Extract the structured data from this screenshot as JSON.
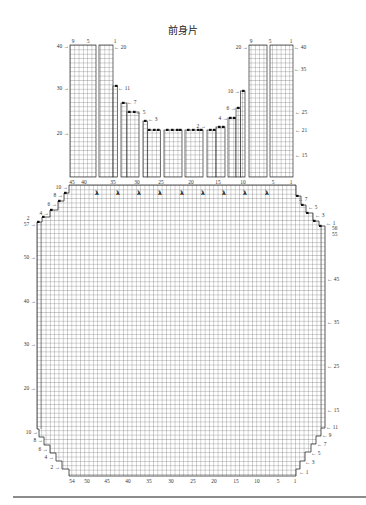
{
  "title": "前身片",
  "colors": {
    "grid_line": "#5a5a5a",
    "outline": "#2e2e2e",
    "text": "#333333",
    "footer_rule": "#666666"
  },
  "diagram": {
    "cell": {
      "w": 4.3,
      "h": 4.38
    },
    "upper_section": {
      "bottom": 177,
      "blocks": [
        {
          "x": 70,
          "w": 26,
          "top": 45
        },
        {
          "x": 99,
          "w": 14,
          "top": 45
        },
        {
          "x": 113,
          "w": 4.3,
          "top": 86
        },
        {
          "x": 121,
          "w": 6,
          "top": 103
        },
        {
          "x": 127,
          "w": 12,
          "top": 112
        },
        {
          "x": 143,
          "w": 4.3,
          "top": 121
        },
        {
          "x": 147.3,
          "w": 13,
          "top": 130
        },
        {
          "x": 164,
          "w": 18,
          "top": 130
        },
        {
          "x": 185,
          "w": 18,
          "top": 130
        },
        {
          "x": 207,
          "w": 9,
          "top": 130
        },
        {
          "x": 216,
          "w": 9,
          "top": 127
        },
        {
          "x": 228,
          "w": 8,
          "top": 118
        },
        {
          "x": 236,
          "w": 4.5,
          "top": 108
        },
        {
          "x": 240.5,
          "w": 4.5,
          "top": 91
        },
        {
          "x": 249,
          "w": 18,
          "top": 45
        },
        {
          "x": 270,
          "w": 23,
          "top": 45
        }
      ],
      "column_label_y": 184,
      "column_labels": [
        {
          "t": "45",
          "x": 72
        },
        {
          "t": "40",
          "x": 84
        },
        {
          "t": "35",
          "x": 113
        },
        {
          "t": "30",
          "x": 137
        },
        {
          "t": "25",
          "x": 161
        },
        {
          "t": "20",
          "x": 191
        },
        {
          "t": "15",
          "x": 218
        },
        {
          "t": "10",
          "x": 243
        },
        {
          "t": "5",
          "x": 273
        },
        {
          "t": "1",
          "x": 291
        }
      ]
    },
    "body": {
      "outline": [
        [
          69,
          185
        ],
        [
          296,
          185
        ],
        [
          296,
          196
        ],
        [
          301,
          196
        ],
        [
          301,
          205
        ],
        [
          306,
          205
        ],
        [
          306,
          213
        ],
        [
          313,
          213
        ],
        [
          313,
          221
        ],
        [
          319,
          221
        ],
        [
          319,
          226
        ],
        [
          325,
          226
        ],
        [
          325,
          428
        ],
        [
          321,
          428
        ],
        [
          321,
          436
        ],
        [
          316,
          436
        ],
        [
          316,
          444
        ],
        [
          311,
          444
        ],
        [
          311,
          452
        ],
        [
          305,
          452
        ],
        [
          305,
          461
        ],
        [
          300,
          461
        ],
        [
          300,
          469
        ],
        [
          296,
          469
        ],
        [
          296,
          476
        ],
        [
          69,
          476
        ],
        [
          69,
          469
        ],
        [
          62,
          469
        ],
        [
          62,
          461
        ],
        [
          56,
          461
        ],
        [
          56,
          453
        ],
        [
          50,
          453
        ],
        [
          50,
          445
        ],
        [
          44,
          445
        ],
        [
          44,
          437
        ],
        [
          39,
          437
        ],
        [
          39,
          429
        ],
        [
          37,
          429
        ],
        [
          37,
          222
        ],
        [
          42,
          222
        ],
        [
          42,
          217
        ],
        [
          50,
          217
        ],
        [
          50,
          210
        ],
        [
          58,
          210
        ],
        [
          58,
          201
        ],
        [
          64,
          201
        ],
        [
          64,
          193
        ],
        [
          69,
          193
        ]
      ],
      "column_label_y": 483,
      "column_labels": [
        {
          "t": "54",
          "x": 72
        },
        {
          "t": "50",
          "x": 87
        },
        {
          "t": "45",
          "x": 107
        },
        {
          "t": "40",
          "x": 128
        },
        {
          "t": "35",
          "x": 149
        },
        {
          "t": "30",
          "x": 171
        },
        {
          "t": "25",
          "x": 193
        },
        {
          "t": "20",
          "x": 214
        },
        {
          "t": "15",
          "x": 236
        },
        {
          "t": "10",
          "x": 257
        },
        {
          "t": "5",
          "x": 278
        },
        {
          "t": "1",
          "x": 295
        }
      ]
    },
    "decrease_marks": {
      "symbol": "λ",
      "y": 195,
      "x": [
        97,
        118,
        139,
        160,
        182,
        203,
        224,
        245,
        267
      ]
    },
    "bind_off_dots": [
      [
        115,
        86
      ],
      [
        122,
        103
      ],
      [
        128,
        112
      ],
      [
        133,
        112
      ],
      [
        144,
        121
      ],
      [
        148,
        130
      ],
      [
        153,
        130
      ],
      [
        157,
        130
      ],
      [
        166,
        130
      ],
      [
        171,
        130
      ],
      [
        176,
        130
      ],
      [
        179,
        130
      ],
      [
        187,
        130
      ],
      [
        192,
        130
      ],
      [
        197,
        130
      ],
      [
        200,
        130
      ],
      [
        209,
        130
      ],
      [
        213,
        130
      ],
      [
        218,
        127
      ],
      [
        222,
        127
      ],
      [
        229,
        118
      ],
      [
        233,
        118
      ],
      [
        237,
        108
      ],
      [
        242,
        91
      ],
      [
        64,
        193
      ],
      [
        58,
        201
      ],
      [
        50,
        210
      ],
      [
        42,
        217
      ],
      [
        37,
        222
      ],
      [
        296,
        196
      ],
      [
        301,
        205
      ],
      [
        306,
        213
      ],
      [
        313,
        221
      ],
      [
        319,
        226
      ]
    ],
    "labels": [
      {
        "t": "9",
        "x": 73,
        "y": 43,
        "a": "middle"
      },
      {
        "t": "5",
        "x": 88,
        "y": 43,
        "a": "middle"
      },
      {
        "t": "1",
        "x": 115,
        "y": 43,
        "a": "middle"
      },
      {
        "t": "9",
        "x": 251,
        "y": 43,
        "a": "middle"
      },
      {
        "t": "5",
        "x": 270,
        "y": 43,
        "a": "middle"
      },
      {
        "t": "1",
        "x": 291,
        "y": 43,
        "a": "middle"
      },
      {
        "t": "40 →",
        "x": 69,
        "y": 48,
        "a": "end"
      },
      {
        "t": "30 →",
        "x": 69,
        "y": 90,
        "a": "end"
      },
      {
        "t": "20 →",
        "x": 69,
        "y": 135,
        "a": "end"
      },
      {
        "t": "← 20",
        "x": 114,
        "y": 49,
        "a": "start"
      },
      {
        "t": "← 11",
        "x": 118,
        "y": 90,
        "a": "start"
      },
      {
        "t": "← 7",
        "x": 127,
        "y": 104,
        "a": "start"
      },
      {
        "t": "← 5",
        "x": 136,
        "y": 114,
        "a": "start"
      },
      {
        "t": "← 3",
        "x": 148,
        "y": 121,
        "a": "start"
      },
      {
        "t": "20 →",
        "x": 248,
        "y": 49,
        "a": "end"
      },
      {
        "t": "← 40",
        "x": 294,
        "y": 49,
        "a": "start"
      },
      {
        "t": "← 35",
        "x": 294,
        "y": 71,
        "a": "start"
      },
      {
        "t": "← 25",
        "x": 295,
        "y": 114,
        "a": "start"
      },
      {
        "t": "← 21",
        "x": 295,
        "y": 132,
        "a": "start"
      },
      {
        "t": "← 15",
        "x": 295,
        "y": 157,
        "a": "start"
      },
      {
        "t": "10 →",
        "x": 240,
        "y": 93,
        "a": "end"
      },
      {
        "t": "6 →",
        "x": 236,
        "y": 110,
        "a": "end"
      },
      {
        "t": "4 →",
        "x": 228,
        "y": 120,
        "a": "end"
      },
      {
        "t": "2 →",
        "x": 206,
        "y": 128,
        "a": "end"
      },
      {
        "t": "10 →",
        "x": 68,
        "y": 189,
        "a": "end"
      },
      {
        "t": "8 →",
        "x": 63,
        "y": 197,
        "a": "end"
      },
      {
        "t": "6 →",
        "x": 57,
        "y": 206,
        "a": "end"
      },
      {
        "t": "4 →",
        "x": 49,
        "y": 215,
        "a": "end"
      },
      {
        "t": "2",
        "x": 28,
        "y": 220,
        "a": "middle"
      },
      {
        "t": "57 →",
        "x": 36,
        "y": 226,
        "a": "end"
      },
      {
        "t": "50 →",
        "x": 36,
        "y": 259,
        "a": "end"
      },
      {
        "t": "40 →",
        "x": 36,
        "y": 303,
        "a": "end"
      },
      {
        "t": "30 →",
        "x": 36,
        "y": 346,
        "a": "end"
      },
      {
        "t": "20 →",
        "x": 36,
        "y": 390,
        "a": "end"
      },
      {
        "t": "10 →",
        "x": 38,
        "y": 434,
        "a": "end"
      },
      {
        "t": "8 →",
        "x": 43,
        "y": 442,
        "a": "end"
      },
      {
        "t": "6 →",
        "x": 48,
        "y": 451,
        "a": "end"
      },
      {
        "t": "4 →",
        "x": 54,
        "y": 459,
        "a": "end"
      },
      {
        "t": "2 →",
        "x": 60,
        "y": 469,
        "a": "end"
      },
      {
        "t": "← 7",
        "x": 298,
        "y": 201,
        "a": "start"
      },
      {
        "t": "← 5",
        "x": 308,
        "y": 209,
        "a": "start"
      },
      {
        "t": "← 3",
        "x": 315,
        "y": 217,
        "a": "start"
      },
      {
        "t": "← 1",
        "x": 326,
        "y": 225,
        "a": "start"
      },
      {
        "t": "56",
        "x": 332,
        "y": 230,
        "a": "start"
      },
      {
        "t": "55",
        "x": 332,
        "y": 236,
        "a": "start"
      },
      {
        "t": "← 45",
        "x": 327,
        "y": 281,
        "a": "start"
      },
      {
        "t": "← 35",
        "x": 327,
        "y": 324,
        "a": "start"
      },
      {
        "t": "← 25",
        "x": 327,
        "y": 368,
        "a": "start"
      },
      {
        "t": "← 15",
        "x": 327,
        "y": 412,
        "a": "start"
      },
      {
        "t": "← 11",
        "x": 326,
        "y": 429,
        "a": "start"
      },
      {
        "t": "← 9",
        "x": 322,
        "y": 437,
        "a": "start"
      },
      {
        "t": "← 7",
        "x": 317,
        "y": 446,
        "a": "start"
      },
      {
        "t": "← 5",
        "x": 311,
        "y": 455,
        "a": "start"
      },
      {
        "t": "← 3",
        "x": 305,
        "y": 464,
        "a": "start"
      },
      {
        "t": "← 1",
        "x": 299,
        "y": 474,
        "a": "start"
      }
    ],
    "footer_rule": {
      "x1": 13,
      "x2": 366,
      "y": 497
    }
  }
}
